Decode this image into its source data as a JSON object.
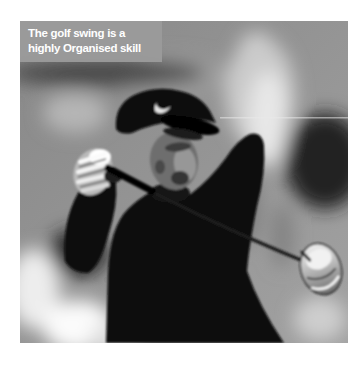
{
  "page": {
    "background_color": "#ffffff"
  },
  "photo": {
    "type": "photograph",
    "description": "Black-and-white photo of a golfer in a dark cap and shirt holding his follow-through, driver club head at lower right, blurred crowd background",
    "caption_line1": "The golf swing is a",
    "caption_line2": "highly Organised skill",
    "caption_bg": "#9b9b9b",
    "caption_text_color": "#ffffff",
    "icons": {
      "cap_logo": "nike-swoosh-icon"
    }
  }
}
